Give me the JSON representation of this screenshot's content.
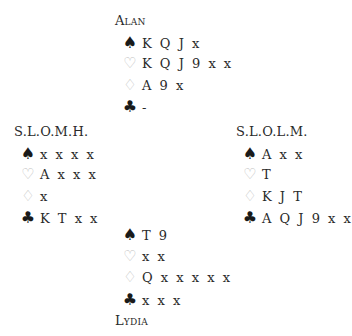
{
  "hands": {
    "north": {
      "name": "Alan",
      "spades": "K Q J x",
      "hearts": "K Q J 9 x x",
      "diamonds": "A 9 x",
      "clubs": "-"
    },
    "west": {
      "name": "S.L.O.M.H.",
      "spades": "x x x x",
      "hearts": "A x x x",
      "diamonds": "x",
      "clubs": "K T x x"
    },
    "east": {
      "name": "S.L.O.L.M.",
      "spades": "A x x",
      "hearts": "T",
      "diamonds": "K J T",
      "clubs": "A Q J 9 x x"
    },
    "south": {
      "name": "Lydia",
      "spades": "T 9",
      "hearts": "x x",
      "diamonds": "Q x x x x x",
      "clubs": "x x x"
    }
  },
  "icons": {
    "spades": "♠",
    "hearts": "♡",
    "diamonds": "♢",
    "clubs": "♣"
  },
  "colors": {
    "black_suit": "#1a1a1a",
    "red_suit_outline": "#bdbdbd",
    "text": "#2a2a2a"
  }
}
